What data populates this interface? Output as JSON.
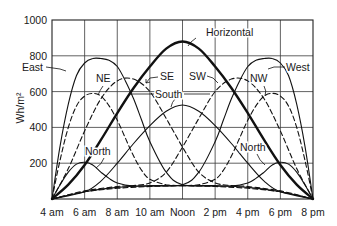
{
  "chart_data": {
    "type": "line",
    "title": "",
    "xlabel": "",
    "ylabel": "Wh/m²",
    "ylim": [
      0,
      1000
    ],
    "xlim_hours": [
      4,
      20
    ],
    "grid": true,
    "legend": "inline labels",
    "x_tick_labels": [
      "4 am",
      "6 am",
      "8 am",
      "10 am",
      "Noon",
      "2 pm",
      "4 pm",
      "6 pm",
      "8 pm"
    ],
    "y_tick_labels": [
      "200",
      "400",
      "600",
      "800",
      "1000"
    ],
    "y_ticks": [
      200,
      400,
      600,
      800,
      1000
    ],
    "series": [
      {
        "name": "Horizontal",
        "style": "bold",
        "x": [
          4,
          5,
          6,
          7,
          8,
          9,
          10,
          11,
          12,
          13,
          14,
          15,
          16,
          17,
          18,
          19,
          20
        ],
        "values": [
          0,
          80,
          190,
          330,
          480,
          620,
          740,
          840,
          880,
          840,
          740,
          620,
          480,
          330,
          190,
          80,
          0
        ]
      },
      {
        "name": "East",
        "style": "solid",
        "x": [
          4,
          4.5,
          5,
          5.5,
          6,
          6.5,
          7,
          7.5,
          8,
          8.5,
          9,
          9.5,
          10,
          11,
          12,
          14,
          16,
          18,
          20
        ],
        "values": [
          0,
          300,
          530,
          690,
          760,
          785,
          785,
          775,
          740,
          660,
          560,
          440,
          320,
          150,
          80,
          75,
          65,
          40,
          0
        ]
      },
      {
        "name": "West",
        "style": "solid",
        "x": [
          4,
          6,
          8,
          10,
          12,
          13,
          14,
          14.5,
          15,
          15.5,
          16,
          16.5,
          17,
          17.5,
          18,
          18.5,
          19,
          19.5,
          20
        ],
        "values": [
          0,
          40,
          65,
          75,
          80,
          150,
          320,
          440,
          560,
          660,
          740,
          775,
          785,
          785,
          760,
          690,
          530,
          300,
          0
        ]
      },
      {
        "name": "NE",
        "style": "dashed",
        "x": [
          4,
          4.5,
          5,
          5.5,
          6,
          6.5,
          7,
          7.5,
          8,
          8.5,
          9,
          9.5,
          10,
          11,
          12,
          14,
          16,
          18,
          20
        ],
        "values": [
          0,
          220,
          400,
          520,
          575,
          590,
          575,
          520,
          440,
          340,
          240,
          160,
          110,
          80,
          75,
          70,
          60,
          40,
          0
        ]
      },
      {
        "name": "NW",
        "style": "dashed",
        "x": [
          4,
          6,
          8,
          10,
          12,
          13,
          14,
          14.5,
          15,
          15.5,
          16,
          16.5,
          17,
          17.5,
          18,
          18.5,
          19,
          19.5,
          20
        ],
        "values": [
          0,
          40,
          60,
          70,
          75,
          80,
          110,
          160,
          240,
          340,
          440,
          520,
          575,
          590,
          575,
          520,
          400,
          220,
          0
        ]
      },
      {
        "name": "SE",
        "style": "dashed",
        "x": [
          4,
          5,
          6,
          7,
          8,
          9,
          10,
          11,
          12,
          13,
          14,
          15,
          16,
          18,
          20
        ],
        "values": [
          0,
          170,
          380,
          560,
          660,
          670,
          600,
          450,
          290,
          150,
          90,
          75,
          70,
          45,
          0
        ]
      },
      {
        "name": "SW",
        "style": "dashed",
        "x": [
          4,
          6,
          8,
          9,
          10,
          11,
          12,
          13,
          14,
          15,
          16,
          17,
          18,
          19,
          20
        ],
        "values": [
          0,
          45,
          70,
          75,
          90,
          150,
          290,
          450,
          600,
          670,
          660,
          560,
          380,
          170,
          0
        ]
      },
      {
        "name": "South",
        "style": "solid",
        "x": [
          4,
          6,
          7,
          8,
          9,
          10,
          11,
          12,
          13,
          14,
          15,
          16,
          17,
          18,
          20
        ],
        "values": [
          0,
          40,
          100,
          200,
          310,
          410,
          490,
          525,
          490,
          410,
          310,
          200,
          100,
          40,
          0
        ]
      },
      {
        "name": "North",
        "style": "solid",
        "x": [
          4,
          4.5,
          5,
          5.5,
          6,
          6.5,
          7,
          7.5,
          8,
          9,
          10,
          12,
          14,
          15,
          16,
          16.5,
          17,
          17.5,
          18,
          18.5,
          19,
          19.5,
          20
        ],
        "values": [
          0,
          80,
          150,
          195,
          205,
          190,
          150,
          115,
          90,
          72,
          72,
          75,
          72,
          72,
          90,
          115,
          150,
          190,
          205,
          195,
          150,
          80,
          0
        ]
      }
    ],
    "annotations": [
      {
        "text": "Horizontal",
        "x": 206,
        "y": 36
      },
      {
        "text": "East",
        "x": 22,
        "y": 71
      },
      {
        "text": "West",
        "x": 286,
        "y": 71
      },
      {
        "text": "NE",
        "x": 96,
        "y": 82
      },
      {
        "text": "NW",
        "x": 250,
        "y": 82
      },
      {
        "text": "SE",
        "x": 160,
        "y": 80
      },
      {
        "text": "SW",
        "x": 189,
        "y": 80
      },
      {
        "text": "South",
        "x": 155,
        "y": 98
      },
      {
        "text": "North",
        "x": 85,
        "y": 155
      },
      {
        "text": "North",
        "x": 240,
        "y": 151
      }
    ]
  }
}
